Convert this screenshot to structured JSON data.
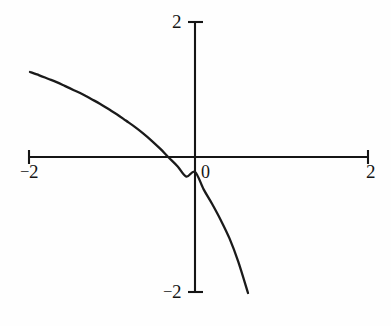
{
  "figure": {
    "background_color": "#fefefe",
    "ink_color": "#151515",
    "curve_color": "#1a1a1a"
  },
  "axis_labels": {
    "y_top": "2",
    "y_bottom": "2",
    "x_left": "2",
    "x_right": "2",
    "origin": "0"
  },
  "chart_data": {
    "type": "line",
    "title": "",
    "subtitle": "",
    "xlabel": "",
    "ylabel": "",
    "xlim": [
      -2,
      2
    ],
    "ylim": [
      -2,
      2
    ],
    "xticks": [
      -2,
      0,
      2
    ],
    "yticks": [
      -2,
      0,
      2
    ],
    "xtick_labels": [
      "-2",
      "0",
      "2"
    ],
    "ytick_labels": [
      "-2",
      "0",
      "2"
    ],
    "grid": false,
    "legend": false,
    "legend_position": "none",
    "axes_style": "centered-cross-with-end-ticks",
    "annotations": [],
    "series": [
      {
        "name": "curve",
        "description": "decreasing concave-down curve crossing x-axis near x=-0.31 and y-axis near y=-0.22",
        "x": [
          -1.91,
          -1.8,
          -1.7,
          -1.6,
          -1.5,
          -1.4,
          -1.3,
          -1.2,
          -1.1,
          -1.0,
          -0.9,
          -0.8,
          -0.7,
          -0.6,
          -0.5,
          -0.4,
          -0.31,
          -0.2,
          -0.1,
          0.0,
          0.1,
          0.2,
          0.3,
          0.4,
          0.5,
          0.61
        ],
        "y": [
          1.26,
          1.21,
          1.16,
          1.11,
          1.05,
          0.99,
          0.93,
          0.86,
          0.79,
          0.71,
          0.63,
          0.54,
          0.45,
          0.35,
          0.24,
          0.12,
          0.0,
          -0.14,
          -0.29,
          -0.22,
          -0.48,
          -0.7,
          -0.94,
          -1.21,
          -1.55,
          -2.01
        ]
      }
    ]
  },
  "geometry": {
    "origin_px": [
      195,
      157
    ],
    "x_axis_left_px": 29,
    "x_axis_right_px": 368,
    "y_axis_top_px": 22,
    "y_axis_bottom_px": 292,
    "px_per_unit_x": 86.5,
    "px_per_unit_y": 67.5,
    "tick_half_len_px": 7,
    "curve_start_px": [
      30,
      72
    ],
    "curve_end_px": [
      248,
      293
    ]
  }
}
